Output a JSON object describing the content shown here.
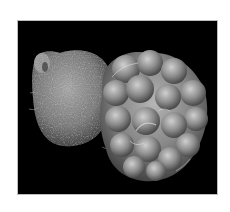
{
  "image": {
    "kind": "scanning-electron-micrograph",
    "subject": "two-part specimen: fibrous rough spherical body (left) attached to lobed globular cluster (right)",
    "background_color": "#000000",
    "page_color": "#ffffff",
    "frame_border_color": "#bdbdbd",
    "tones": {
      "rough_body": "#8a8a8a",
      "rough_highlight": "#c8c8c8",
      "lobe_base": "#7c7c7c",
      "lobe_highlight": "#d9d9d9",
      "lobe_shadow": "#3a3a3a"
    }
  }
}
